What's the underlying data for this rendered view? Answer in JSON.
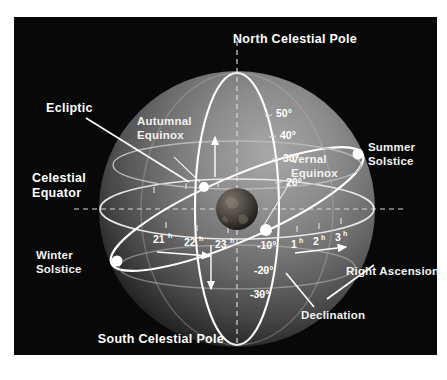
{
  "figure": {
    "background_color": "#ffffff",
    "panel_color": "#080808",
    "line_color": "#ffffff",
    "sphere_highlight": "#b9b9b9"
  },
  "labels": {
    "north_celestial_pole": "North Celestial Pole",
    "south_celestial_pole": "South Celestial Pole",
    "ecliptic": "Ecliptic",
    "celestial_equator_line1": "Celestial",
    "celestial_equator_line2": "Equator",
    "autumnal_equinox_line1": "Autumnal",
    "autumnal_equinox_line2": "Equinox",
    "vernal_equinox_line1": "Vernal",
    "vernal_equinox_line2": "Equinox",
    "summer_solstice_line1": "Summer",
    "summer_solstice_line2": "Solstice",
    "winter_solstice_line1": "Winter",
    "winter_solstice_line2": "Solstice",
    "right_ascension": "Right Ascension",
    "declination": "Declination"
  },
  "declination_ticks": [
    {
      "label": "50°",
      "value": 50,
      "x": 262,
      "y": 96
    },
    {
      "label": "40°",
      "value": 40,
      "x": 262,
      "y": 116
    },
    {
      "label": "30°",
      "value": 30,
      "x": 262,
      "y": 138
    },
    {
      "label": "20°",
      "value": 20,
      "x": 262,
      "y": 162
    },
    {
      "label": "-10°",
      "value": -10,
      "x": 258,
      "y": 228
    },
    {
      "label": "-20°",
      "value": -20,
      "x": 258,
      "y": 254
    },
    {
      "label": "-30°",
      "value": -30,
      "x": 258,
      "y": 279
    }
  ],
  "right_ascension_ticks": [
    {
      "label": "21",
      "unit": "h",
      "value": 21,
      "x": 146,
      "y": 222
    },
    {
      "label": "22",
      "unit": "h",
      "value": 22,
      "x": 177,
      "y": 224
    },
    {
      "label": "23",
      "unit": "h",
      "value": 23,
      "x": 208,
      "y": 226
    },
    {
      "label": "1",
      "unit": "h",
      "value": 1,
      "x": 275,
      "y": 226
    },
    {
      "label": "2",
      "unit": "h",
      "value": 2,
      "x": 297,
      "y": 223
    },
    {
      "label": "3",
      "unit": "h",
      "value": 3,
      "x": 319,
      "y": 219
    }
  ],
  "markers": [
    {
      "name": "autumnal-equinox-point",
      "x": 190,
      "y": 170
    },
    {
      "name": "vernal-equinox-point",
      "x": 252,
      "y": 213
    },
    {
      "name": "summer-solstice-point",
      "x": 344,
      "y": 137
    },
    {
      "name": "winter-solstice-point",
      "x": 103,
      "y": 244
    },
    {
      "name": "north-celestial-pole-point",
      "x": 223,
      "y": 62
    }
  ],
  "earth": {
    "name": "earth-globe",
    "cx": 223,
    "cy": 192,
    "r": 21
  }
}
